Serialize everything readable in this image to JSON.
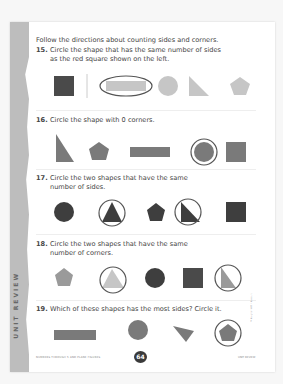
{
  "intro": "Follow the directions about counting sides and corners.",
  "questions": [
    {
      "number": "15.",
      "line1": "Circle the shape that has the same number of sides",
      "line2": "as the red square shown on the left."
    },
    {
      "number": "16.",
      "line1": "Circle the shape with 0 corners.",
      "line2": ""
    },
    {
      "number": "17.",
      "line1": "Circle the two shapes that have the same",
      "line2": "number of sides."
    },
    {
      "number": "18.",
      "line1": "Circle the two shapes that have the same",
      "line2": "number of corners."
    },
    {
      "number": "19.",
      "line1": "Which of these shapes has the most sides? Circle it.",
      "line2": ""
    }
  ],
  "shapes": {
    "q15": [
      "square (reference)",
      "rectangle (circled)",
      "circle",
      "right triangle",
      "pentagon"
    ],
    "q16": [
      "right triangle",
      "pentagon",
      "rectangle",
      "circle (circled)",
      "square"
    ],
    "q17": [
      "circle",
      "triangle (circled)",
      "pentagon",
      "right triangle (circled)",
      "square"
    ],
    "q18": [
      "pentagon",
      "triangle (circled)",
      "circle",
      "square",
      "right triangle (circled)"
    ],
    "q19": [
      "rectangle",
      "circle",
      "triangle",
      "pentagon (circled)"
    ]
  },
  "band_label": "UNIT REVIEW",
  "footer": {
    "left": "NUMBERS THROUGH 5 AND PLANE FIGURES",
    "page_number": "64",
    "right": "UNIT REVIEW"
  },
  "copyright": "© Houghton Mifflin Harcourt",
  "colors": {
    "dark": "#4a4a4a",
    "medium": "#8a8a8a",
    "light": "#c6c6c6",
    "band": "#bdbdbd"
  }
}
